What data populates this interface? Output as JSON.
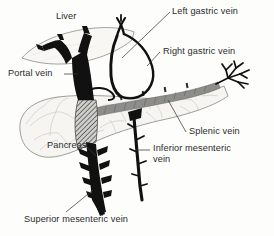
{
  "figure": {
    "type": "anatomical-illustration",
    "background_color": "#fdfdfb",
    "ink_color": "#111111",
    "text_color": "#2b2b2b"
  },
  "labels": {
    "liver": "Liver",
    "portal_vein": "Portal vein",
    "left_gastric_vein": "Left gastric vein",
    "right_gastric_vein": "Right gastric vein",
    "splenic_vein": "Splenic vein",
    "inferior_mesenteric_vein": "Inferior mesenteric vein",
    "pancreas": "Pancreas",
    "superior_mesenteric_vein": "Superior mesenteric vein"
  },
  "structures": [
    {
      "name": "liver",
      "fill": "#f7f6f2",
      "stroke": "#8d8d88"
    },
    {
      "name": "pancreas",
      "fill": "#f6f5f1",
      "stroke": "#8d8d88"
    },
    {
      "name": "portal-vein",
      "fill": "#111111"
    },
    {
      "name": "gastric-vein-loop",
      "fill": "#111111"
    },
    {
      "name": "splenic-vein",
      "fill": "#8a8a86"
    },
    {
      "name": "confluence",
      "fill": "hatched"
    },
    {
      "name": "superior-mesenteric-vein",
      "fill": "#111111"
    },
    {
      "name": "inferior-mesenteric-vein",
      "fill": "#111111"
    }
  ]
}
